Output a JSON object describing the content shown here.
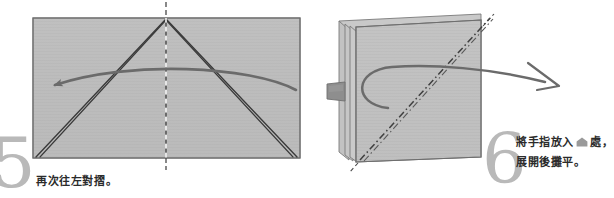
{
  "document": {
    "type": "origami-instruction-diagram",
    "language": "zh-Hant",
    "background_color": "#ffffff",
    "width": 614,
    "height": 198
  },
  "palette": {
    "paper_fill": "#bdbdbd",
    "paper_fill_light": "#c7c7c7",
    "paper_edge": "#6e6e6e",
    "fold_line": "#3a3a3a",
    "arrow": "#6b6b6b",
    "dashed_line": "#4a4a4a",
    "step_number": "#b9b9b9",
    "caption_text": "#2b2b2b",
    "clip_tab": "#8a8a8a",
    "marker_icon": "#9a9a9a"
  },
  "steps": [
    {
      "id": "step-5",
      "number": "5",
      "caption": "再次往左對摺。",
      "diagram": {
        "name": "folded-rectangle-with-creases",
        "shape": "rectangle",
        "shading": "horizontal wood-grain texture",
        "center_line": "vertical dash-dot axis",
        "crease_lines": "four diagonals converging at top-centre apex",
        "arrow": {
          "name": "fold-left-arrow",
          "direction": "right-to-left curved",
          "head_style": "solid"
        }
      }
    },
    {
      "id": "step-6",
      "number": "6",
      "caption_line1_before": "將手指放入",
      "caption_marker": "pentagon-marker-icon",
      "caption_line1_after": "處，",
      "caption_line2": "展開後攤平。",
      "diagram": {
        "name": "layered-paper-stack",
        "shape": "square stack of folded sheets",
        "layers": 4,
        "diagonal_line": "dash-dot diagonal from bottom-left to top-right",
        "clip": {
          "name": "finger-insert-tab",
          "position": "left edge, mid height"
        },
        "arrow": {
          "name": "open-out-arrow",
          "direction": "loop sweeping right",
          "head_style": "open outline"
        }
      }
    }
  ]
}
